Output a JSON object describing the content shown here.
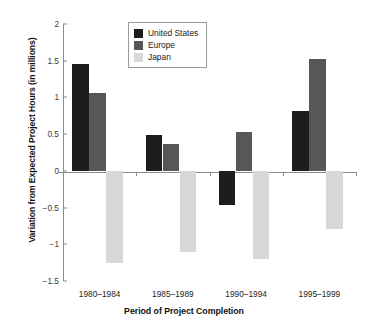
{
  "chart_data": {
    "type": "bar",
    "title": "",
    "xlabel": "Period of Project Completion",
    "ylabel": "Variation from Expected Project Hours (in millions)",
    "categories": [
      "1980–1984",
      "1985–1989",
      "1990–1994",
      "1995–1999"
    ],
    "series": [
      {
        "name": "United States",
        "color": "#1d1d1d",
        "values": [
          1.46,
          0.49,
          -0.47,
          0.82
        ]
      },
      {
        "name": "Europe",
        "color": "#575757",
        "values": [
          1.06,
          0.37,
          0.53,
          1.52
        ]
      },
      {
        "name": "Japan",
        "color": "#d8d8d8",
        "values": [
          -1.25,
          -1.1,
          -1.2,
          -0.79
        ]
      }
    ],
    "ylim": [
      -1.5,
      2
    ],
    "yticks": [
      "2",
      "1.5",
      "1",
      "0.5",
      "0",
      "−0.5",
      "−1",
      "−1.5"
    ],
    "ytick_values": [
      2,
      1.5,
      1,
      0.5,
      0,
      -0.5,
      -1,
      -1.5
    ],
    "grid": false,
    "legend_position": "top-center",
    "zero_line": true
  },
  "legend": {
    "items": [
      {
        "label": "United States",
        "swatch": "us"
      },
      {
        "label": "Europe",
        "swatch": "eu"
      },
      {
        "label": "Japan",
        "swatch": "jp"
      }
    ]
  }
}
